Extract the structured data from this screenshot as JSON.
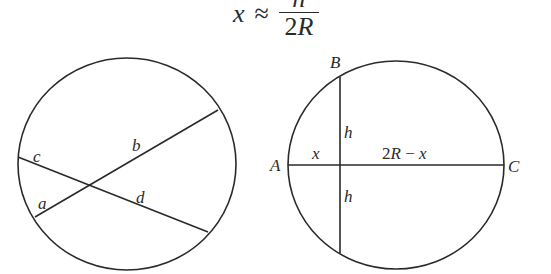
{
  "formula": {
    "lhs": "x",
    "relation": "≈",
    "numerator": "h",
    "denominator_coef": "2",
    "denominator_var": "R"
  },
  "diagrams": [
    {
      "name": "intersecting-chords",
      "circle": {
        "cx": 127,
        "cy": 164,
        "rx": 109,
        "ry": 106
      },
      "chords": [
        {
          "name": "chord-ab",
          "from": [
            35,
            217
          ],
          "to": [
            218,
            110
          ],
          "segments": [
            "a",
            "b"
          ]
        },
        {
          "name": "chord-cd",
          "from": [
            18,
            157
          ],
          "to": [
            208,
            232
          ],
          "segments": [
            "c",
            "d"
          ]
        }
      ],
      "labels": {
        "a": "a",
        "b": "b",
        "c": "c",
        "d": "d"
      }
    },
    {
      "name": "diameter-perpendicular-chord",
      "circle": {
        "cx": 396,
        "cy": 165,
        "rx": 108,
        "ry": 104
      },
      "diameter": {
        "from": [
          288,
          165
        ],
        "to": [
          504,
          165
        ]
      },
      "chord": {
        "from": [
          340,
          77
        ],
        "to": [
          340,
          253
        ]
      },
      "labels": {
        "A": "A",
        "B": "B",
        "C": "C",
        "x": "x",
        "two_r_minus_x": "2R − x",
        "h_upper": "h",
        "h_lower": "h"
      }
    }
  ],
  "colors": {
    "stroke": "#2a2a2a",
    "background": "#ffffff"
  }
}
